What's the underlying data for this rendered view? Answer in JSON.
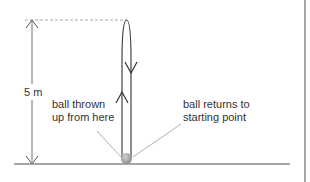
{
  "diagram": {
    "height_label": "5 m",
    "start_label": {
      "line1": "ball thrown",
      "line2": "up from here"
    },
    "return_label": {
      "line1": "ball returns to",
      "line2": "starting point"
    },
    "colors": {
      "line": "#555555",
      "dashed": "#aaaaaa",
      "ground": "#888888",
      "ball": "#a0a0a0",
      "text": "#333333"
    }
  }
}
